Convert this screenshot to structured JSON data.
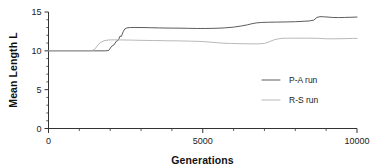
{
  "chart_data": {
    "type": "line",
    "title": "",
    "xlabel": "Generations",
    "ylabel": "Mean Length L",
    "xlim": [
      0,
      10000
    ],
    "ylim": [
      0,
      15
    ],
    "grid": false,
    "legend_position": "center-right",
    "xticks": [
      0,
      5000,
      10000
    ],
    "xtick_labels": [
      "0",
      "5000",
      "10000"
    ],
    "xminor_step": 1000,
    "yticks": [
      0,
      5,
      10,
      15
    ],
    "ytick_labels": [
      "0",
      "5",
      "10",
      "15"
    ],
    "yminor_step": 1,
    "series": [
      {
        "name": "P-A run",
        "color": "#4a4a4a",
        "width": 0.9,
        "points": [
          [
            0,
            10.0
          ],
          [
            200,
            10.0
          ],
          [
            500,
            10.0
          ],
          [
            900,
            10.0
          ],
          [
            1200,
            10.0
          ],
          [
            1500,
            10.0
          ],
          [
            1700,
            10.0
          ],
          [
            1850,
            10.0
          ],
          [
            1950,
            10.05
          ],
          [
            2050,
            10.6
          ],
          [
            2120,
            10.75
          ],
          [
            2200,
            11.25
          ],
          [
            2260,
            11.35
          ],
          [
            2320,
            11.9
          ],
          [
            2360,
            11.85
          ],
          [
            2420,
            12.45
          ],
          [
            2470,
            12.8
          ],
          [
            2540,
            12.95
          ],
          [
            2650,
            13.0
          ],
          [
            2800,
            13.0
          ],
          [
            3000,
            13.0
          ],
          [
            3300,
            12.98
          ],
          [
            3600,
            12.95
          ],
          [
            3900,
            12.93
          ],
          [
            4200,
            12.92
          ],
          [
            4500,
            12.9
          ],
          [
            4800,
            12.88
          ],
          [
            5100,
            12.88
          ],
          [
            5400,
            12.9
          ],
          [
            5700,
            12.95
          ],
          [
            6000,
            13.05
          ],
          [
            6250,
            13.2
          ],
          [
            6450,
            13.35
          ],
          [
            6600,
            13.5
          ],
          [
            6750,
            13.6
          ],
          [
            6900,
            13.65
          ],
          [
            7100,
            13.68
          ],
          [
            7400,
            13.7
          ],
          [
            7700,
            13.72
          ],
          [
            8000,
            13.75
          ],
          [
            8250,
            13.8
          ],
          [
            8450,
            13.85
          ],
          [
            8600,
            13.95
          ],
          [
            8700,
            14.3
          ],
          [
            8800,
            14.4
          ],
          [
            8950,
            14.38
          ],
          [
            9200,
            14.3
          ],
          [
            9400,
            14.28
          ],
          [
            9600,
            14.3
          ],
          [
            9800,
            14.32
          ],
          [
            10000,
            14.35
          ]
        ]
      },
      {
        "name": "R-S run",
        "color": "#b0b0b0",
        "width": 0.9,
        "points": [
          [
            0,
            10.0
          ],
          [
            300,
            10.0
          ],
          [
            700,
            10.0
          ],
          [
            1000,
            10.0
          ],
          [
            1250,
            10.0
          ],
          [
            1400,
            10.02
          ],
          [
            1500,
            10.2
          ],
          [
            1600,
            10.75
          ],
          [
            1700,
            11.1
          ],
          [
            1800,
            11.3
          ],
          [
            1950,
            11.4
          ],
          [
            2150,
            11.42
          ],
          [
            2400,
            11.4
          ],
          [
            2700,
            11.38
          ],
          [
            3000,
            11.35
          ],
          [
            3400,
            11.33
          ],
          [
            3800,
            11.3
          ],
          [
            4200,
            11.28
          ],
          [
            4600,
            11.25
          ],
          [
            5000,
            11.2
          ],
          [
            5300,
            11.1
          ],
          [
            5600,
            11.0
          ],
          [
            5900,
            10.95
          ],
          [
            6200,
            10.92
          ],
          [
            6500,
            10.9
          ],
          [
            6800,
            10.9
          ],
          [
            7000,
            10.95
          ],
          [
            7150,
            11.15
          ],
          [
            7300,
            11.4
          ],
          [
            7450,
            11.55
          ],
          [
            7600,
            11.62
          ],
          [
            7900,
            11.63
          ],
          [
            8300,
            11.63
          ],
          [
            8700,
            11.62
          ],
          [
            9000,
            11.55
          ],
          [
            9300,
            11.55
          ],
          [
            9600,
            11.57
          ],
          [
            9850,
            11.6
          ],
          [
            10000,
            11.6
          ]
        ]
      }
    ],
    "legend_entries": [
      {
        "label": "P-A run",
        "color": "#4a4a4a"
      },
      {
        "label": "R-S run",
        "color": "#b0b0b0"
      }
    ]
  },
  "axes": {
    "y_title": "Mean Length L",
    "x_title": "Generations"
  }
}
